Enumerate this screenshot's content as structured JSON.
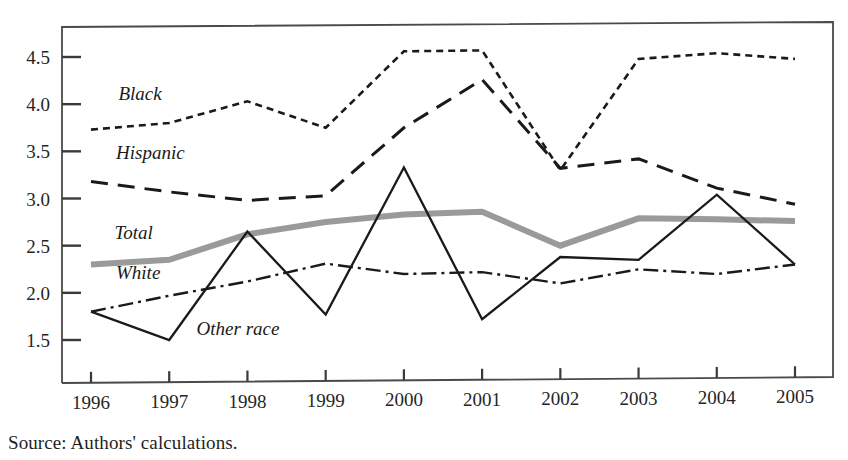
{
  "chart_data": {
    "type": "line",
    "title": "",
    "xlabel": "",
    "ylabel": "",
    "categories": [
      "1996",
      "1997",
      "1998",
      "1999",
      "2000",
      "2001",
      "2002",
      "2003",
      "2004",
      "2005"
    ],
    "xlim": [
      1996,
      2005
    ],
    "ylim": [
      1.28,
      4.85
    ],
    "yticks": [
      1.5,
      2.0,
      2.5,
      3.0,
      3.5,
      4.0,
      4.5
    ],
    "ytick_labels": [
      "1.5",
      "2.0",
      "2.5",
      "3.0",
      "3.5",
      "4.0",
      "4.5"
    ],
    "grid": false,
    "legend_position": "inline-labels-left",
    "series": [
      {
        "name": "Black",
        "label": "Black",
        "style": "short-dash",
        "color": "#1a1a1a",
        "width": 2.6,
        "dash": "7,5",
        "values": [
          3.73,
          3.8,
          4.03,
          3.75,
          4.56,
          4.57,
          3.3,
          4.48,
          4.54,
          4.48
        ],
        "label_x": 1996.35,
        "label_y": 4.04
      },
      {
        "name": "Hispanic",
        "label": "Hispanic",
        "style": "long-dash",
        "color": "#1a1a1a",
        "width": 3.0,
        "dash": "17,10",
        "values": [
          3.18,
          3.07,
          2.98,
          3.03,
          3.75,
          4.26,
          3.32,
          3.42,
          3.11,
          2.94
        ],
        "label_x": 1996.32,
        "label_y": 3.42
      },
      {
        "name": "Total",
        "label": "Total",
        "style": "solid-thick-gray",
        "color": "#9a9a9a",
        "width": 6.0,
        "dash": "none",
        "values": [
          2.3,
          2.35,
          2.62,
          2.75,
          2.83,
          2.86,
          2.5,
          2.79,
          2.78,
          2.76
        ],
        "label_x": 1996.3,
        "label_y": 2.57
      },
      {
        "name": "White",
        "label": "White",
        "style": "dash-dot",
        "color": "#1a1a1a",
        "width": 2.4,
        "dash": "15,5,3,5",
        "values": [
          1.8,
          1.97,
          2.12,
          2.31,
          2.2,
          2.22,
          2.1,
          2.25,
          2.2,
          2.3
        ],
        "label_x": 1996.32,
        "label_y": 2.15
      },
      {
        "name": "Other race",
        "label": "Other race",
        "style": "solid-thin",
        "color": "#1a1a1a",
        "width": 2.3,
        "dash": "none",
        "values": [
          1.8,
          1.5,
          2.65,
          1.77,
          3.33,
          1.72,
          2.38,
          2.35,
          3.04,
          2.3
        ],
        "label_x": 1997.35,
        "label_y": 1.55
      }
    ]
  },
  "source": {
    "text": "Source: Authors' calculations."
  }
}
